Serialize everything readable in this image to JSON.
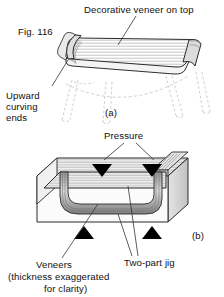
{
  "figure": {
    "number_label": "Fig. 116",
    "panels": [
      {
        "id": "a",
        "caption": "(a)"
      },
      {
        "id": "b",
        "caption": "(b)"
      }
    ]
  },
  "labels": {
    "decorative_veneer": "Decorative veneer on top",
    "upward_line1": "Upward",
    "upward_line2": "curving",
    "upward_line3": "ends",
    "pressure": "Pressure",
    "veneers": "Veneers",
    "veneers_note_line1": "(thickness exaggerated",
    "veneers_note_line2": "for clarity)",
    "two_part_jig": "Two-part jig"
  },
  "colors": {
    "background": "#ffffff",
    "ink": "#111111",
    "line": "#333333",
    "ghost_line": "#b8b8b8",
    "hatch": "#8a8a8a",
    "shade_light": "#e8e8e8",
    "shade_mid": "#c9c9c9",
    "shade_dark": "#9b9b9b",
    "solid_marker": "#000000"
  },
  "graphics": {
    "tray": {
      "name": "curved-tray-table",
      "description": "parallelogram tray top with upward curving ends and horizontal veneer hatching",
      "legs_style": "ghost-dashed"
    },
    "jig": {
      "name": "two-part-jig-block",
      "description": "rectangular block jig with curved recess holding veneer laminate"
    },
    "markers": {
      "pressure_down_count": 2,
      "pressure_up_count": 2,
      "down_glyph": "solid-down-triangle",
      "up_glyph": "solid-up-triangle"
    }
  }
}
